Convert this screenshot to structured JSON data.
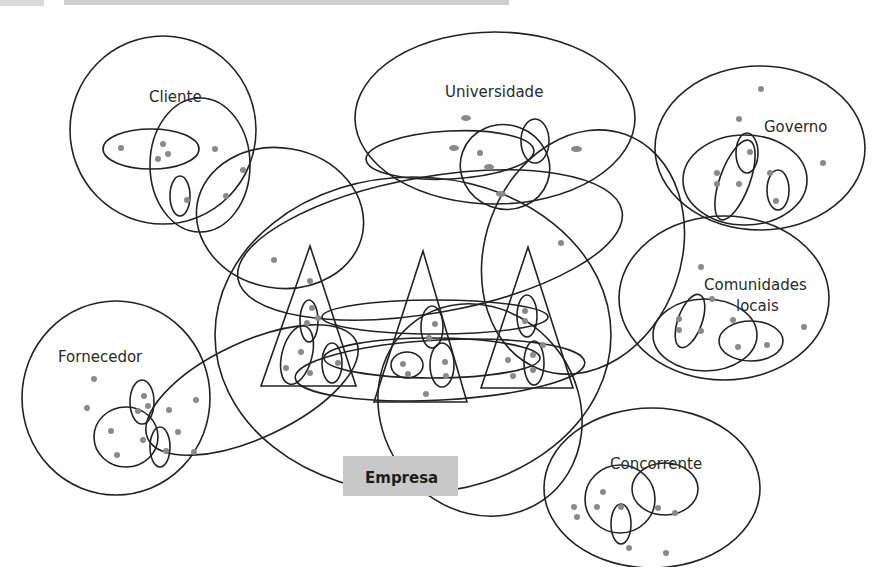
{
  "header": {
    "caption_truncated": "(partially visible caption text at top edge)"
  },
  "diagram": {
    "center_label": "Empresa",
    "actors": [
      {
        "id": "cliente",
        "label": "Cliente"
      },
      {
        "id": "universidade",
        "label": "Universidade"
      },
      {
        "id": "governo",
        "label": "Governo"
      },
      {
        "id": "comunidades",
        "label_line1": "Comunidades",
        "label_line2": "locais"
      },
      {
        "id": "fornecedor",
        "label": "Fornecedor"
      },
      {
        "id": "concorrente",
        "label": "Concorrente"
      }
    ],
    "internal_units": [
      {
        "id": "unit-1",
        "shape": "triangle"
      },
      {
        "id": "unit-2",
        "shape": "triangle"
      },
      {
        "id": "unit-3",
        "shape": "triangle"
      }
    ]
  },
  "colors": {
    "outline": "#222222",
    "node": "#8a8a8a",
    "empresa_fill": "#c8c8c8"
  }
}
